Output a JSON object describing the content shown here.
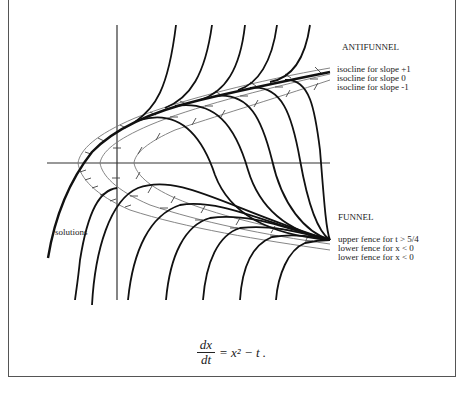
{
  "figure": {
    "labels": {
      "antifunnel": "ANTIFUNNEL",
      "antifunnel_isoclines": [
        "isocline for slope +1",
        "isocline for slope 0",
        "isocline for slope -1"
      ],
      "funnel": "FUNNEL",
      "funnel_fences": [
        "upper fence for t > 5/4",
        "lower fence for x < 0",
        "lower fence for x < 0"
      ],
      "solutions": "solutions"
    },
    "equation": {
      "numerator": "dx",
      "denominator": "dt",
      "rhs": "= x² − t ."
    },
    "colors": {
      "solution_curve": "#111111",
      "isocline": "#777777",
      "axis": "#333333",
      "frame": "#555555"
    }
  }
}
